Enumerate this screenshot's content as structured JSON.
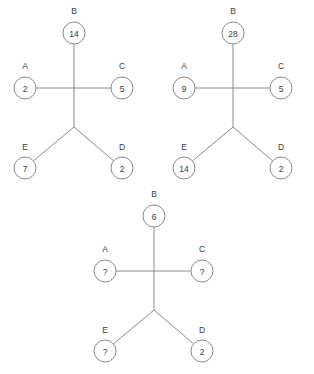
{
  "page": {
    "background_color": "#ffffff",
    "stroke_color": "#8a8a8a",
    "text_color": "#3a3a3a",
    "node_radius": 11,
    "title": ""
  },
  "chart_data": {
    "type": "diagram",
    "title": "",
    "diagrams": [
      {
        "name": "diagram-1",
        "center_x": 74,
        "cross_y": 88,
        "fork_y": 127,
        "nodes": [
          {
            "label": "B",
            "value": "14",
            "cx": 74,
            "cy": 33,
            "label_x": 74,
            "label_y": 11
          },
          {
            "label": "A",
            "value": "2",
            "cx": 25,
            "cy": 88,
            "label_x": 25,
            "label_y": 66
          },
          {
            "label": "C",
            "value": "5",
            "cx": 122,
            "cy": 88,
            "label_x": 122,
            "label_y": 66
          },
          {
            "label": "E",
            "value": "7",
            "cx": 25,
            "cy": 168,
            "label_x": 25,
            "label_y": 147
          },
          {
            "label": "D",
            "value": "2",
            "cx": 122,
            "cy": 168,
            "label_x": 122,
            "label_y": 147
          }
        ]
      },
      {
        "name": "diagram-2",
        "center_x": 233,
        "cross_y": 88,
        "fork_y": 127,
        "nodes": [
          {
            "label": "B",
            "value": "28",
            "cx": 233,
            "cy": 33,
            "label_x": 233,
            "label_y": 11
          },
          {
            "label": "A",
            "value": "9",
            "cx": 184,
            "cy": 88,
            "label_x": 184,
            "label_y": 66
          },
          {
            "label": "C",
            "value": "5",
            "cx": 281,
            "cy": 88,
            "label_x": 281,
            "label_y": 66
          },
          {
            "label": "E",
            "value": "14",
            "cx": 184,
            "cy": 168,
            "label_x": 184,
            "label_y": 147
          },
          {
            "label": "D",
            "value": "2",
            "cx": 281,
            "cy": 168,
            "label_x": 281,
            "label_y": 147
          }
        ]
      },
      {
        "name": "diagram-3",
        "center_x": 154,
        "cross_y": 271,
        "fork_y": 310,
        "nodes": [
          {
            "label": "B",
            "value": "6",
            "cx": 154,
            "cy": 216,
            "label_x": 154,
            "label_y": 194
          },
          {
            "label": "A",
            "value": "?",
            "cx": 105,
            "cy": 271,
            "label_x": 105,
            "label_y": 249
          },
          {
            "label": "C",
            "value": "?",
            "cx": 202,
            "cy": 271,
            "label_x": 202,
            "label_y": 249
          },
          {
            "label": "E",
            "value": "?",
            "cx": 105,
            "cy": 351,
            "label_x": 105,
            "label_y": 330
          },
          {
            "label": "D",
            "value": "2",
            "cx": 202,
            "cy": 351,
            "label_x": 202,
            "label_y": 330
          }
        ]
      }
    ]
  }
}
